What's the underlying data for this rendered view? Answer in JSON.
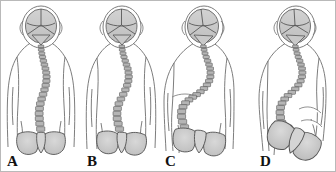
{
  "figure": {
    "view": "posterior",
    "panel_count": 4,
    "background_color": "#ffffff",
    "border_color": "#b9b9b9",
    "palette": {
      "outline": "#6e6e6e",
      "body_fill": "#ffffff",
      "bone_fill": "#c9c9c9",
      "bone_fill_light": "#dcdcdc",
      "bone_outline": "#555555",
      "vertebra_fill": "#b5b5b5",
      "vertebra_outline": "#4a4a4a",
      "label_color": "#111111",
      "shadow": "#e3e3e3"
    },
    "panels": [
      {
        "id": "a",
        "label": "A",
        "severity": "mild",
        "description": "Mild S-shaped curve, level shoulders and pelvis",
        "curve_magnitude": 1,
        "pelvis_tilt_deg": 0,
        "trunk_shift_px": 0,
        "vertebra_count": 22,
        "pelvis_view": "frontal"
      },
      {
        "id": "b",
        "label": "B",
        "severity": "moderate",
        "description": "Moderate double curve with slight trunk shift",
        "curve_magnitude": 2,
        "pelvis_tilt_deg": 3,
        "trunk_shift_px": 3,
        "vertebra_count": 22,
        "pelvis_view": "frontal"
      },
      {
        "id": "c",
        "label": "C",
        "severity": "severe",
        "description": "Severe curve, trunk leaning, rib hump, pelvis obliquity",
        "curve_magnitude": 3,
        "pelvis_tilt_deg": 6,
        "trunk_shift_px": 7,
        "vertebra_count": 22,
        "pelvis_view": "frontal-oblique"
      },
      {
        "id": "d",
        "label": "D",
        "severity": "very-severe",
        "description": "Collapsing curve with marked pelvic rotation and obliquity",
        "curve_magnitude": 4,
        "pelvis_tilt_deg": 22,
        "trunk_shift_px": 10,
        "vertebra_count": 22,
        "pelvis_view": "rotated-oblique"
      }
    ],
    "anatomy_parts": [
      "skull",
      "cranial-sutures",
      "cervical-spine",
      "thoracic-spine",
      "lumbar-spine",
      "sacrum",
      "ilium-left",
      "ilium-right",
      "torso-outline",
      "arms"
    ]
  }
}
